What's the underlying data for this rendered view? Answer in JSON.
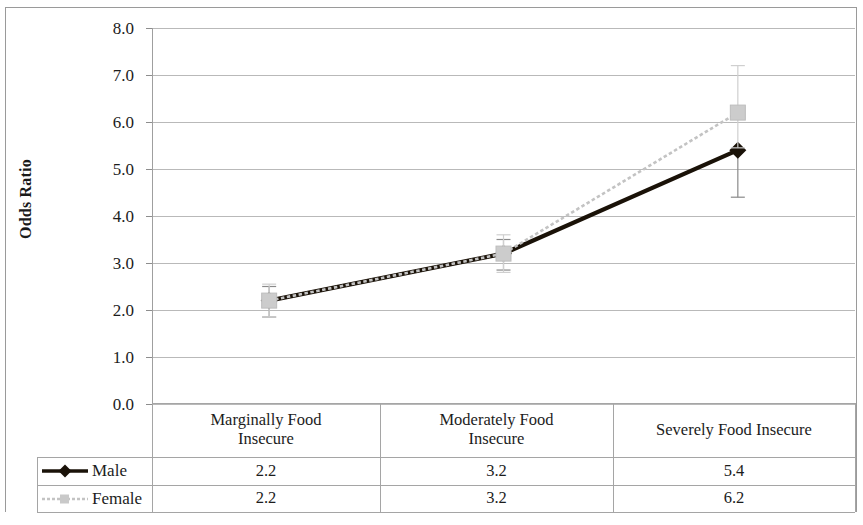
{
  "chart_data": {
    "type": "line",
    "title": "",
    "xlabel": "",
    "ylabel": "Odds Ratio",
    "ylim": [
      0.0,
      8.0
    ],
    "ytick_labels": [
      "8.0",
      "7.0",
      "6.0",
      "5.0",
      "4.0",
      "3.0",
      "2.0",
      "1.0",
      "0.0"
    ],
    "ytick_values": [
      8.0,
      7.0,
      6.0,
      5.0,
      4.0,
      3.0,
      2.0,
      1.0,
      0.0
    ],
    "grid": true,
    "legend_position": "data-table-left",
    "categories": [
      "Marginally Food Insecure",
      "Moderately Food Insecure",
      "Severely Food Insecure"
    ],
    "series": [
      {
        "name": "Male",
        "values": [
          2.2,
          3.2,
          5.4
        ],
        "value_labels": [
          "2.2",
          "3.2",
          "5.4"
        ],
        "error_low": [
          1.85,
          2.85,
          4.4
        ],
        "error_high": [
          2.5,
          3.5,
          5.4
        ],
        "color": "#1a1208",
        "marker": "diamond",
        "line_style": "solid"
      },
      {
        "name": "Female",
        "values": [
          2.2,
          3.2,
          6.2
        ],
        "value_labels": [
          "2.2",
          "3.2",
          "6.2"
        ],
        "error_low": [
          1.85,
          2.8,
          5.45
        ],
        "error_high": [
          2.55,
          3.6,
          7.2
        ],
        "color": "#c3c3c3",
        "marker": "square",
        "line_style": "dotted"
      }
    ]
  },
  "table": {
    "header_row": [
      "Marginally Food\nInsecure",
      "Moderately Food\nInsecure",
      "Severely Food Insecure"
    ],
    "header_lines": [
      [
        "Marginally Food",
        "Insecure"
      ],
      [
        "Moderately Food",
        "Insecure"
      ],
      [
        "Severely Food Insecure"
      ]
    ],
    "rows": [
      {
        "legend": "Male",
        "cells": [
          "2.2",
          "3.2",
          "5.4"
        ]
      },
      {
        "legend": "Female",
        "cells": [
          "2.2",
          "3.2",
          "6.2"
        ]
      }
    ]
  },
  "colors": {
    "male_line": "#1a1208",
    "female_line": "#c3c3c3",
    "grid": "#b9b9b9",
    "text": "#1c1c1c",
    "frame": "#9a9a9a"
  }
}
